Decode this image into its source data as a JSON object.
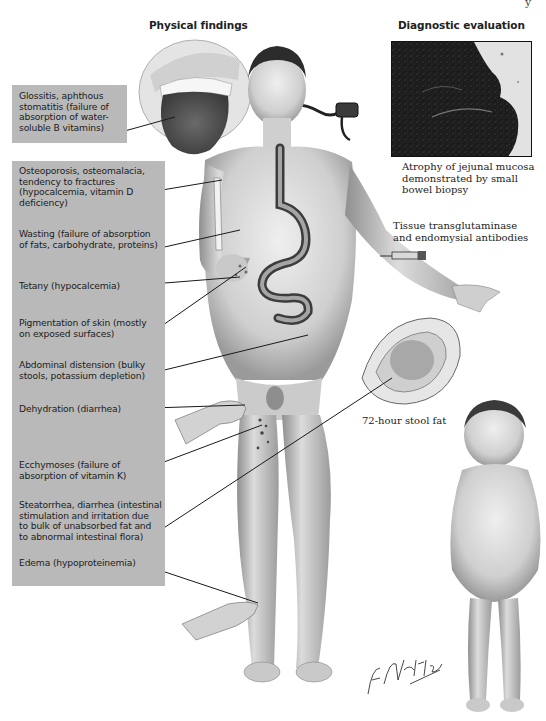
{
  "figure": {
    "corner_fragment": "y",
    "sections": {
      "physical_findings": "Physical findings",
      "diagnostic_evaluation": "Diagnostic evaluation"
    },
    "findings": [
      {
        "id": "glossitis",
        "text": "Glossitis, aphthous stomatitis (failure of absorption of water-soluble B vitamins)"
      },
      {
        "id": "osteoporosis",
        "text": "Osteoporosis, osteomalacia, tendency to fractures (hypocalcemia, vitamin D deficiency)"
      },
      {
        "id": "wasting",
        "text": "Wasting (failure of absorption of fats, carbohydrate, proteins)"
      },
      {
        "id": "tetany",
        "text": "Tetany (hypocalcemia)"
      },
      {
        "id": "pigmentation",
        "text": "Pigmentation of skin (mostly on exposed surfaces)"
      },
      {
        "id": "abdominal",
        "text": "Abdominal distension (bulky stools, potassium depletion)"
      },
      {
        "id": "dehydration",
        "text": "Dehydration (diarrhea)"
      },
      {
        "id": "ecchymoses",
        "text": "Ecchymoses (failure of absorption of vitamin K)"
      },
      {
        "id": "steatorrhea",
        "text": "Steatorrhea, diarrhea (intestinal stimulation and irritation due to bulk of unabsorbed fat and to abnormal intestinal flora)"
      },
      {
        "id": "edema",
        "text": "Edema (hypoproteinemia)"
      }
    ],
    "findings_lines": {
      "glossitis": [
        "Glossitis, aphthous",
        "stomatitis (failure of",
        "absorption of water-",
        "soluble B vitamins)"
      ],
      "osteoporosis": [
        "Osteoporosis, osteomalacia,",
        "tendency to fractures",
        "(hypocalcemia, vitamin D",
        "deficiency)"
      ],
      "wasting": [
        "Wasting (failure of absorption",
        "of fats, carbohydrate, proteins)"
      ],
      "tetany": [
        "Tetany (hypocalcemia)"
      ],
      "pigmentation": [
        "Pigmentation of skin (mostly",
        "on exposed surfaces)"
      ],
      "abdominal": [
        "Abdominal distension (bulky",
        "stools, potassium depletion)"
      ],
      "dehydration": [
        "Dehydration (diarrhea)"
      ],
      "ecchymoses": [
        "Ecchymoses (failure of",
        "absorption of vitamin K)"
      ],
      "steatorrhea": [
        "Steatorrhea, diarrhea (intestinal",
        "stimulation and irritation due",
        "to bulk of unabsorbed fat and",
        "to abnormal intestinal flora)"
      ],
      "edema": [
        "Edema (hypoproteinemia)"
      ]
    },
    "diagnostics": {
      "biopsy_lines": [
        "Atrophy of jejunal mucosa",
        "demonstrated by small",
        "bowel biopsy"
      ],
      "antibodies_lines": [
        "Tissue transglutaminase",
        "and endomysial antibodies"
      ],
      "stool_fat": "72-hour stool fat"
    },
    "signature": "F. Netter M.D.",
    "colors": {
      "label_box": "#b9b9b9",
      "ink": "#1c1c1c",
      "skin": "#d9d9d9",
      "biopsy_dark": "#1e1e1e"
    }
  }
}
